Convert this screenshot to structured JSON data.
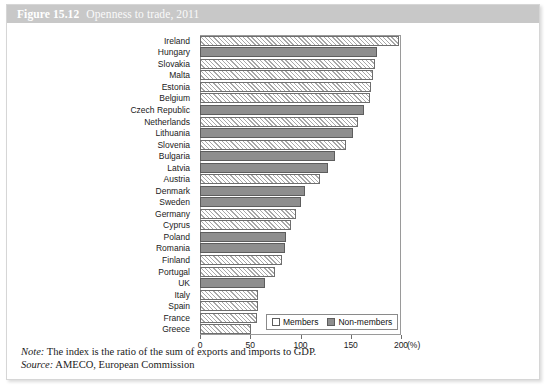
{
  "figure": {
    "number": "Figure 15.12",
    "title": "Openness to trade, 2011"
  },
  "footnotes": {
    "note_label": "Note:",
    "note_text": "The index is the ratio of the sum of exports and imports to GDP.",
    "source_label": "Source:",
    "source_text": "AMECO, European Commission"
  },
  "legend": {
    "members_label": "Members",
    "nonmembers_label": "Non-members"
  },
  "axis": {
    "unit": "(%)",
    "ticks": [
      "0",
      "50",
      "100",
      "150",
      "200"
    ]
  },
  "colors": {
    "header_band": "#c8c8c8",
    "nonmembers_fill": "#8e8e8e",
    "members_fill": "#ffffff",
    "bar_outline": "#6e6e6e",
    "frame": "#9a9a9a"
  },
  "chart_data": {
    "type": "bar",
    "orientation": "horizontal",
    "title": "Openness to trade, 2011",
    "xlabel": "(%)",
    "ylabel": "",
    "xlim": [
      0,
      200
    ],
    "xticks": [
      0,
      50,
      100,
      150,
      200
    ],
    "grid": false,
    "legend_position": "bottom-right",
    "note": "The index is the ratio of the sum of exports and imports to GDP.",
    "source": "AMECO, European Commission",
    "series": [
      {
        "name": "Members",
        "color": "#ffffff",
        "pattern": "diagonal-hatch"
      },
      {
        "name": "Non-members",
        "color": "#8e8e8e",
        "pattern": "solid"
      }
    ],
    "categories": [
      "Ireland",
      "Hungary",
      "Slovakia",
      "Malta",
      "Estonia",
      "Belgium",
      "Czech Republic",
      "Netherlands",
      "Lithuania",
      "Slovenia",
      "Bulgaria",
      "Latvia",
      "Austria",
      "Denmark",
      "Sweden",
      "Germany",
      "Cyprus",
      "Poland",
      "Romania",
      "Finland",
      "Portugal",
      "UK",
      "Italy",
      "Spain",
      "France",
      "Greece"
    ],
    "points": [
      {
        "category": "Ireland",
        "value": 198,
        "group": "Members"
      },
      {
        "category": "Hungary",
        "value": 176,
        "group": "Non-members"
      },
      {
        "category": "Slovakia",
        "value": 174,
        "group": "Members"
      },
      {
        "category": "Malta",
        "value": 172,
        "group": "Members"
      },
      {
        "category": "Estonia",
        "value": 170,
        "group": "Members"
      },
      {
        "category": "Belgium",
        "value": 169,
        "group": "Members"
      },
      {
        "category": "Czech Republic",
        "value": 163,
        "group": "Non-members"
      },
      {
        "category": "Netherlands",
        "value": 157,
        "group": "Members"
      },
      {
        "category": "Lithuania",
        "value": 152,
        "group": "Non-members"
      },
      {
        "category": "Slovenia",
        "value": 145,
        "group": "Members"
      },
      {
        "category": "Bulgaria",
        "value": 134,
        "group": "Non-members"
      },
      {
        "category": "Latvia",
        "value": 127,
        "group": "Non-members"
      },
      {
        "category": "Austria",
        "value": 119,
        "group": "Members"
      },
      {
        "category": "Denmark",
        "value": 104,
        "group": "Non-members"
      },
      {
        "category": "Sweden",
        "value": 100,
        "group": "Non-members"
      },
      {
        "category": "Germany",
        "value": 96,
        "group": "Members"
      },
      {
        "category": "Cyprus",
        "value": 91,
        "group": "Members"
      },
      {
        "category": "Poland",
        "value": 86,
        "group": "Non-members"
      },
      {
        "category": "Romania",
        "value": 85,
        "group": "Non-members"
      },
      {
        "category": "Finland",
        "value": 82,
        "group": "Members"
      },
      {
        "category": "Portugal",
        "value": 75,
        "group": "Members"
      },
      {
        "category": "UK",
        "value": 65,
        "group": "Non-members"
      },
      {
        "category": "Italy",
        "value": 58,
        "group": "Members"
      },
      {
        "category": "Spain",
        "value": 58,
        "group": "Members"
      },
      {
        "category": "France",
        "value": 57,
        "group": "Members"
      },
      {
        "category": "Greece",
        "value": 51,
        "group": "Members"
      }
    ]
  }
}
